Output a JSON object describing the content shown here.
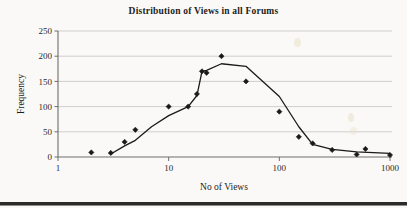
{
  "chart_data": {
    "type": "scatter",
    "title": "Distribution of Views in all Forums",
    "xlabel": "No of Views",
    "ylabel": "Frequency",
    "xscale": "log",
    "xlim": [
      1,
      1000
    ],
    "ylim": [
      0,
      250
    ],
    "grid": true,
    "legend": "none",
    "x_ticks": [
      "1",
      "10",
      "100",
      "1000"
    ],
    "x_tick_values": [
      1,
      10,
      100,
      1000
    ],
    "y_ticks": [
      "0",
      "50",
      "100",
      "150",
      "200",
      "250"
    ],
    "y_tick_values": [
      0,
      50,
      100,
      150,
      200,
      250
    ],
    "marker": "diamond",
    "marker_color": "#1a1a1a",
    "line_color": "#1a1a1a",
    "grid_color": "#c9c9c9",
    "background": "#faf9f7",
    "series": [
      {
        "name": "Frequency",
        "points": [
          {
            "x": 2,
            "y": 9
          },
          {
            "x": 3,
            "y": 8
          },
          {
            "x": 4,
            "y": 30
          },
          {
            "x": 5,
            "y": 54
          },
          {
            "x": 10,
            "y": 100
          },
          {
            "x": 15,
            "y": 100
          },
          {
            "x": 18,
            "y": 125
          },
          {
            "x": 20,
            "y": 170
          },
          {
            "x": 22,
            "y": 167
          },
          {
            "x": 30,
            "y": 200
          },
          {
            "x": 50,
            "y": 150
          },
          {
            "x": 100,
            "y": 90
          },
          {
            "x": 150,
            "y": 40
          },
          {
            "x": 200,
            "y": 27
          },
          {
            "x": 300,
            "y": 14
          },
          {
            "x": 500,
            "y": 5
          },
          {
            "x": 600,
            "y": 16
          },
          {
            "x": 1000,
            "y": 4
          }
        ]
      }
    ],
    "trend_line": [
      {
        "x": 3,
        "y": 6
      },
      {
        "x": 4,
        "y": 22
      },
      {
        "x": 5,
        "y": 33
      },
      {
        "x": 7,
        "y": 60
      },
      {
        "x": 10,
        "y": 82
      },
      {
        "x": 15,
        "y": 100
      },
      {
        "x": 18,
        "y": 122
      },
      {
        "x": 20,
        "y": 170
      },
      {
        "x": 22,
        "y": 172
      },
      {
        "x": 30,
        "y": 185
      },
      {
        "x": 50,
        "y": 180
      },
      {
        "x": 100,
        "y": 120
      },
      {
        "x": 150,
        "y": 60
      },
      {
        "x": 200,
        "y": 25
      },
      {
        "x": 300,
        "y": 15
      },
      {
        "x": 500,
        "y": 10
      },
      {
        "x": 1000,
        "y": 7
      }
    ]
  }
}
